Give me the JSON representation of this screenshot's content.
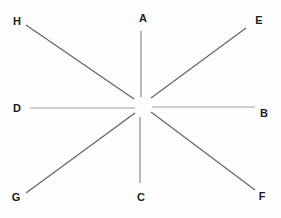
{
  "diagram": {
    "type": "radial-lines-star",
    "background_color": "#fdfdfd",
    "label_color": "#1c1c1c",
    "default_line_color": "#6e6e6e",
    "center": {
      "x": 143,
      "y": 107
    },
    "rays": [
      {
        "label": "A",
        "direction": "up",
        "color": "#8c8c8c",
        "line": [
          141,
          31,
          141,
          97
        ],
        "label_pos": [
          143,
          18
        ]
      },
      {
        "label": "E",
        "direction": "up-right",
        "color": "#636363",
        "line": [
          246,
          28,
          151,
          98
        ],
        "label_pos": [
          259,
          20
        ]
      },
      {
        "label": "B",
        "direction": "right",
        "color": "#a0a0a0",
        "line": [
          255,
          107,
          152,
          107
        ],
        "label_pos": [
          264,
          113
        ]
      },
      {
        "label": "F",
        "direction": "down-right",
        "color": "#636363",
        "line": [
          255,
          190,
          151,
          112
        ],
        "label_pos": [
          262,
          196
        ]
      },
      {
        "label": "C",
        "direction": "down",
        "color": "#8c8c8c",
        "line": [
          140,
          183,
          140,
          117
        ],
        "label_pos": [
          141,
          197
        ]
      },
      {
        "label": "G",
        "direction": "down-left",
        "color": "#636363",
        "line": [
          26,
          193,
          135,
          113
        ],
        "label_pos": [
          16,
          197
        ]
      },
      {
        "label": "D",
        "direction": "left",
        "color": "#a0a0a0",
        "line": [
          30,
          108,
          135,
          108
        ],
        "label_pos": [
          17,
          108
        ]
      },
      {
        "label": "H",
        "direction": "up-left",
        "color": "#636363",
        "line": [
          26,
          25,
          134,
          99
        ],
        "label_pos": [
          17,
          21
        ]
      }
    ]
  }
}
